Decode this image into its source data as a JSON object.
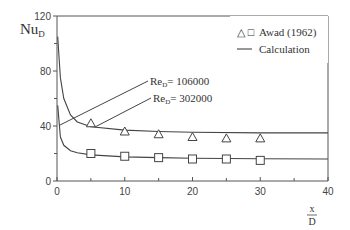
{
  "chart_data": {
    "type": "line",
    "title": "",
    "xlabel_num": "x",
    "xlabel_den": "D",
    "ylabel": "Nu",
    "ylabel_sub": "D",
    "xlim": [
      0,
      40
    ],
    "ylim": [
      0,
      120
    ],
    "x_ticks": [
      0,
      10,
      20,
      30,
      40
    ],
    "x_minor_ticks": [
      5,
      15,
      25,
      35
    ],
    "y_ticks": [
      0,
      40,
      80,
      120
    ],
    "y_minor_ticks": [
      20,
      60,
      100
    ],
    "grid": false,
    "legend": {
      "position": "upper-right",
      "entries": [
        {
          "marker": "△ □",
          "label": "Awad (1962)"
        },
        {
          "marker": "—",
          "label": "Calculation"
        }
      ]
    },
    "annotations": [
      {
        "text_main": "Re",
        "text_sub": "D",
        "text_rest": "= 106000",
        "points_to": "upper-curve"
      },
      {
        "text_main": "Re",
        "text_sub": "D",
        "text_rest": "= 302000",
        "points_to": "lower-curve"
      }
    ],
    "series": [
      {
        "name": "Awad (1962) Re_D=106000",
        "marker": "triangle",
        "x": [
          5,
          10,
          15,
          20,
          25,
          30
        ],
        "y": [
          42,
          36,
          34,
          32,
          31,
          31
        ]
      },
      {
        "name": "Awad (1962) Re_D=302000",
        "marker": "square",
        "x": [
          5,
          10,
          15,
          20,
          25,
          30
        ],
        "y": [
          20,
          18,
          17,
          16,
          16,
          15
        ]
      },
      {
        "name": "Calculation Re_D=106000",
        "marker": "line",
        "x": [
          0.1,
          0.5,
          1,
          2,
          3,
          5,
          10,
          15,
          20,
          30,
          40
        ],
        "y": [
          105,
          75,
          60,
          48,
          43,
          39.5,
          37,
          36,
          35.5,
          35,
          35
        ]
      },
      {
        "name": "Calculation Re_D=302000",
        "marker": "line",
        "x": [
          0.1,
          0.5,
          1,
          2,
          3,
          5,
          10,
          15,
          20,
          30,
          40
        ],
        "y": [
          55,
          32,
          26,
          22,
          20.5,
          19,
          17.5,
          17,
          16.5,
          16.2,
          16
        ]
      }
    ]
  }
}
